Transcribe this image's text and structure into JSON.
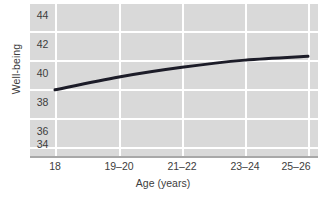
{
  "chart_data": {
    "type": "line",
    "title": "",
    "xlabel": "Age (years)",
    "ylabel": "Well-being",
    "categories": [
      "18",
      "19–20",
      "21–22",
      "23–24",
      "25–26"
    ],
    "x": [
      18,
      19.5,
      21.5,
      23.5,
      25.5
    ],
    "series": [
      {
        "name": "Well-being",
        "values": [
          38.2,
          39.2,
          39.95,
          40.5,
          40.8
        ],
        "color": "#1c1c28"
      }
    ],
    "ylim": [
      33,
      45
    ],
    "yticks": [
      44,
      42,
      40,
      38,
      36,
      34
    ],
    "ytick_labels": [
      "44",
      "42",
      "40",
      "38",
      "36",
      "34"
    ],
    "grid": "white gridlines on gray panel, horizontal and vertical",
    "legend": "none",
    "panel_color": "#d9d9d9",
    "gridline_color": "#ffffff",
    "axis_color": "#a8a8a8"
  },
  "axes": {
    "y_title": "Well-being",
    "x_title": "Age (years)"
  },
  "colors": {
    "line": "#1c1c28",
    "panel": "#d9d9d9",
    "grid": "#ffffff",
    "text": "#3d3d3d",
    "axis": "#a8a8a8"
  }
}
